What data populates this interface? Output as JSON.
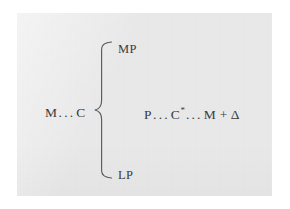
{
  "figure": {
    "kind": "formula-diagram",
    "page_background": "#ffffff",
    "panel_background": "#e9e9e9",
    "ink_color": "#3b3b3b",
    "rule_color": "#5a5a5a"
  },
  "left_term": {
    "prefix": "M",
    "ellipsis": "...",
    "suffix": "C"
  },
  "branches": [
    {
      "id": "mp",
      "label": "MP",
      "position": "top"
    },
    {
      "id": "lp",
      "label": "LP",
      "position": "bottom"
    }
  ],
  "right_term": {
    "first": "P",
    "ellipsis_1": "...",
    "second": "C",
    "superscript": "*",
    "ellipsis_2": "...",
    "third": "M",
    "operator": "+",
    "addend": "Δ"
  },
  "brace": {
    "orientation": "left-facing",
    "spans_labels": [
      "MP",
      "LP"
    ]
  }
}
